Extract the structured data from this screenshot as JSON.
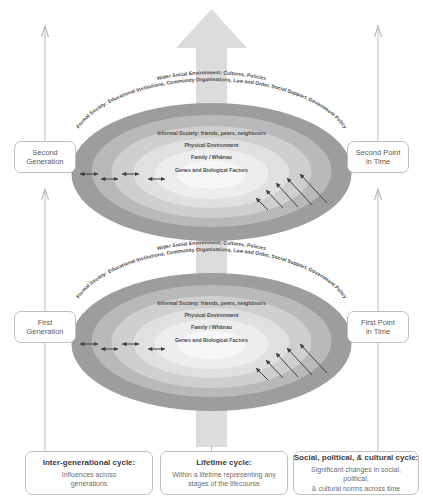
{
  "diagram": {
    "colors": {
      "arrow_big": "#d9d9d9",
      "ring_outer": "#9a9a9a",
      "ring_2": "#b5b5b5",
      "ring_3": "#cccccc",
      "ring_4": "#dedede",
      "ring_5": "#ededed",
      "ring_core": "#f7f7f7",
      "box_border": "#bfbfbf",
      "connector": "#c2c2c2",
      "text": "#4a4a4a",
      "arrow_small": "#444444"
    },
    "rings": [
      {
        "id": "ring-wider-social",
        "label": "Wider Social Environment; Cultures, Policies"
      },
      {
        "id": "ring-formal-society",
        "label": "Formal Society: Educational Institutions, Community Organisations, Law and Order, Social Support, Government Policy"
      },
      {
        "id": "ring-informal-society",
        "label": "Informal Society: friends, peers, neighbours"
      },
      {
        "id": "ring-physical-environment",
        "label": "Physical Environment"
      },
      {
        "id": "ring-family",
        "label": "Family / Whānau"
      },
      {
        "id": "ring-genes",
        "label": "Genes and Biological Factors"
      }
    ],
    "cycles": {
      "upper": {
        "generation_label_line1": "Second",
        "generation_label_line2": "Generation",
        "time_label_line1": "Second Point",
        "time_label_line2": "in Time"
      },
      "lower": {
        "generation_label_line1": "First",
        "generation_label_line2": "Generation",
        "time_label_line1": "First Point",
        "time_label_line2": "in Time"
      }
    },
    "legend": [
      {
        "id": "inter-generational",
        "title": "Inter-generational cycle:",
        "desc_line1": "Influences across",
        "desc_line2": "generations"
      },
      {
        "id": "lifetime",
        "title": "Lifetime cycle:",
        "desc_line1": "Within a lifetime representing any",
        "desc_line2": "stages of the lifecourse"
      },
      {
        "id": "social-political-cultural",
        "title": "Social, political, & cultural cycle:",
        "desc_line1": "Significant changes in social, political,",
        "desc_line2": "& cultural norms across time"
      }
    ]
  }
}
